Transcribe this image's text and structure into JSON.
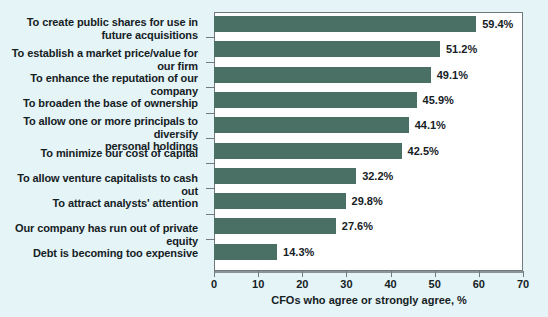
{
  "chart_data": {
    "type": "bar",
    "orientation": "horizontal",
    "title": "",
    "xlabel": "CFOs who agree or strongly agree, %",
    "ylabel": "",
    "xlim": [
      0,
      70
    ],
    "xticks": [
      0,
      10,
      20,
      30,
      40,
      50,
      60,
      70
    ],
    "grid": false,
    "legend": null,
    "bar_color": "#4a6f64",
    "background_color": "#e4f4f7",
    "plot_background_color": "#ffffff",
    "categories": [
      "To create public shares for use in\nfuture acquisitions",
      "To establish a market price/value for our firm",
      "To enhance the reputation of our company",
      "To broaden the base of ownership",
      "To allow one or more principals to diversify\npersonal holdings",
      "To minimize our cost of capital",
      "To allow venture capitalists to cash out",
      "To attract analysts' attention",
      "Our company has run out of private equity",
      "Debt is becoming too expensive"
    ],
    "values": [
      59.4,
      51.2,
      49.1,
      45.9,
      44.1,
      42.5,
      32.2,
      29.8,
      27.6,
      14.3
    ],
    "value_labels": [
      "59.4%",
      "51.2%",
      "49.1%",
      "45.9%",
      "44.1%",
      "42.5%",
      "32.2%",
      "29.8%",
      "27.6%",
      "14.3%"
    ],
    "xtick_labels": [
      "0",
      "10",
      "20",
      "30",
      "40",
      "50",
      "60",
      "70"
    ]
  }
}
